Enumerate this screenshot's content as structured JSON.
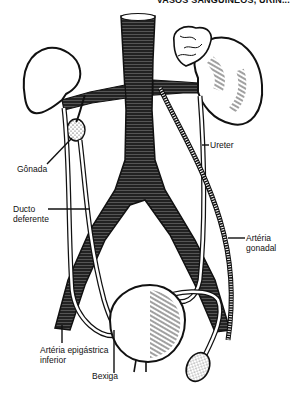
{
  "header": {
    "text": "VASOS SANGUÍNEOS, URIN..."
  },
  "diagram": {
    "labels": {
      "gonada": "Gônada",
      "ureter": "Ureter",
      "ducto_deferente_line1": "Ducto",
      "ducto_deferente_line2": "deferente",
      "arteria_gonadal": "Artéria gonadal",
      "arteria_epigastrica_line1": "Artéria epigástrica",
      "arteria_epigastrica_line2": "inferior",
      "bexiga": "Bexiga"
    },
    "colors": {
      "ink": "#111111",
      "background": "#ffffff"
    }
  }
}
